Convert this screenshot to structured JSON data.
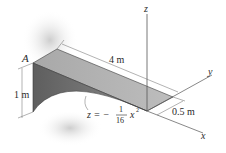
{
  "figure": {
    "point_label": "A",
    "axes": {
      "x": "x",
      "y": "y",
      "z": "z"
    },
    "dimensions": {
      "length": "4 m",
      "height": "1 m",
      "width": "0.5 m"
    },
    "equation": {
      "lhs": "z = −",
      "numerator": "1",
      "denominator": "16",
      "variable": "x",
      "exponent": "2"
    },
    "colors": {
      "top_face": "#b4b4b4",
      "side_face": "#6e6e6e",
      "shadow": "#d6d6d6",
      "line": "#3a3a3a"
    }
  }
}
